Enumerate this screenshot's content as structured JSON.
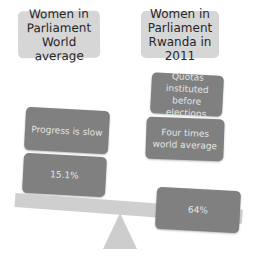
{
  "diagram": {
    "type": "balance-scale",
    "left_side": {
      "header": "Women in Parliament World average",
      "header_lines": [
        "Women in",
        "Parliament",
        "World average"
      ],
      "boxes": [
        {
          "label": "Progress is slow"
        },
        {
          "label": "15.1%"
        }
      ],
      "value": "15.1%"
    },
    "right_side": {
      "header": "Women in Parliament Rwanda in 2011",
      "header_lines": [
        "Women in",
        "Parliament",
        "Rwanda in 2011"
      ],
      "boxes": [
        {
          "label": "Quotas instituted before elections",
          "lines": [
            "Quotas instituted",
            "before elections"
          ]
        },
        {
          "label": "Four times world average",
          "lines": [
            "Four times",
            "world average"
          ]
        },
        {
          "label": "64%"
        }
      ],
      "value": "64%"
    },
    "colors": {
      "header_box": "#d6d6d6",
      "content_box": "#808080",
      "beam": "#cfcfcf",
      "fulcrum": "#cdcdcd"
    }
  }
}
